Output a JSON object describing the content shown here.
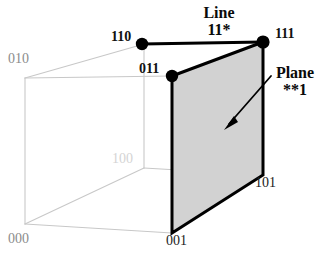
{
  "figure": {
    "type": "cube-lattice-diagram",
    "background_color": "#ffffff",
    "plane_fill_color": "#d2d2d2",
    "plane_edge_color": "#000000",
    "cube_edge_color": "#c8c8c8",
    "line_edge_color": "#000000"
  },
  "vertices": [
    {
      "id": "v000",
      "label": "000",
      "x": 25,
      "y": 224,
      "style": "plain-gray",
      "dot": false
    },
    {
      "id": "v001",
      "label": "001",
      "x": 172,
      "y": 233,
      "style": "plain-dark",
      "dot": false
    },
    {
      "id": "v010",
      "label": "010",
      "x": 25,
      "y": 78,
      "style": "plain-gray",
      "dot": false
    },
    {
      "id": "v011",
      "label": "011",
      "x": 172,
      "y": 76,
      "style": "bold",
      "dot": true
    },
    {
      "id": "v100",
      "label": "100",
      "x": 144,
      "y": 168,
      "style": "plain-faint",
      "dot": false
    },
    {
      "id": "v101",
      "label": "101",
      "x": 263,
      "y": 175,
      "style": "plain-dark",
      "dot": false
    },
    {
      "id": "v110",
      "label": "110",
      "x": 142,
      "y": 44,
      "style": "bold",
      "dot": true
    },
    {
      "id": "v111",
      "label": "111",
      "x": 263,
      "y": 42,
      "style": "bold",
      "dot": true
    }
  ],
  "vertex_labels": {
    "v000": "000",
    "v001": "001",
    "v010": "010",
    "v011": "011",
    "v100": "100",
    "v101": "101",
    "v110": "110",
    "v111": "111"
  },
  "annotations": {
    "line": {
      "title": "Line",
      "code": "11*"
    },
    "plane": {
      "title": "Plane",
      "code": "**1"
    }
  },
  "highlights": {
    "line_11star": {
      "from": "v110",
      "to": "v111",
      "description": "Line 11*"
    },
    "plane_starstar1": {
      "vertices": [
        "v011",
        "v111",
        "v101",
        "v001"
      ],
      "description": "Plane **1"
    }
  }
}
